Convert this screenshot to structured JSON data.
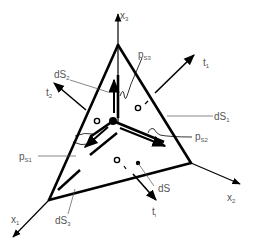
{
  "diagram": {
    "type": "tetrahedron-stress-element",
    "colors": {
      "stroke": "#000000",
      "label": "#555555",
      "background": "#ffffff"
    },
    "axes": [
      {
        "id": "x1",
        "base": "x",
        "sub": "1"
      },
      {
        "id": "x2",
        "base": "x",
        "sub": "2"
      },
      {
        "id": "x3",
        "base": "x",
        "sub": "3"
      }
    ],
    "labels": {
      "x1": {
        "base": "x",
        "sub": "1"
      },
      "x2": {
        "base": "x",
        "sub": "2"
      },
      "x3": {
        "base": "x",
        "sub": "3"
      },
      "t1_top": {
        "base": "t",
        "sub": "1"
      },
      "t2": {
        "base": "t",
        "sub": "2"
      },
      "t1_bottom": {
        "base": "t",
        "sub": "i"
      },
      "dS1": {
        "base": "dS",
        "sub": "1"
      },
      "dS2": {
        "base": "dS",
        "sub": "2"
      },
      "dS3": {
        "base": "dS",
        "sub": "3"
      },
      "dS": {
        "base": "dS",
        "sub": ""
      },
      "pS1": {
        "base": "p",
        "sub": "S1"
      },
      "pS2": {
        "base": "p",
        "sub": "S2"
      },
      "pS3": {
        "base": "p",
        "sub": "S3"
      }
    }
  }
}
